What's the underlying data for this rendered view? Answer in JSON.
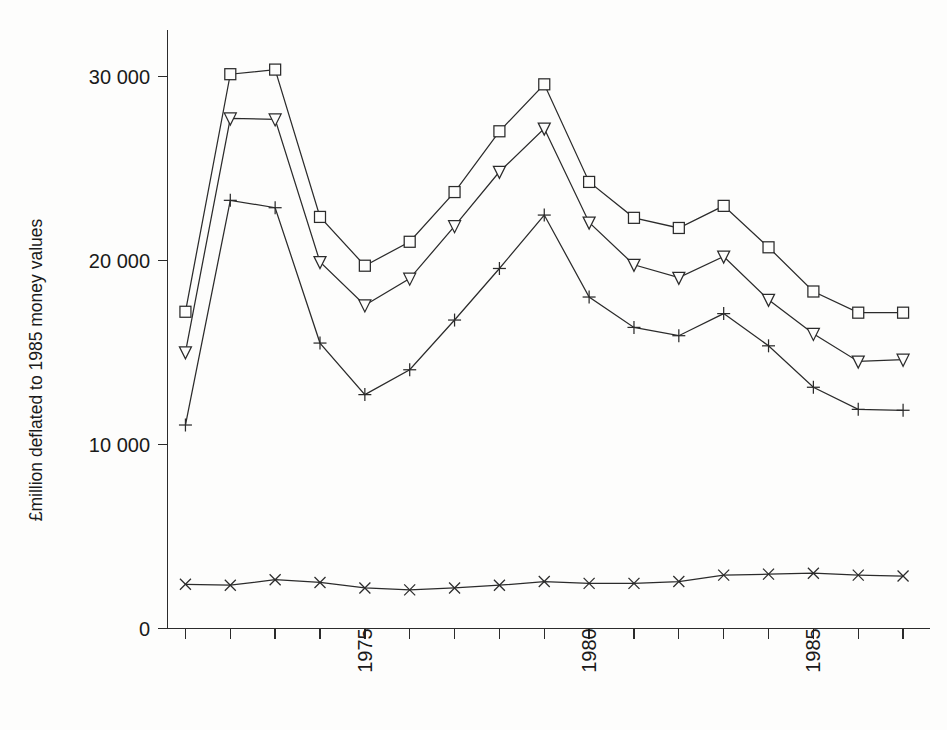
{
  "chart_data": {
    "type": "line",
    "title": "",
    "subtitle": "",
    "xlabel": "",
    "ylabel": "£million deflated to 1985 money values",
    "x": [
      1971,
      1972,
      1973,
      1974,
      1975,
      1976,
      1977,
      1978,
      1979,
      1980,
      1981,
      1982,
      1983,
      1984,
      1985,
      1986,
      1987
    ],
    "xlim": [
      1970.6,
      1987.6
    ],
    "ylim": [
      0,
      32500
    ],
    "yticks": [
      0,
      10000,
      20000,
      30000
    ],
    "ytick_labels": [
      "0",
      "10 000",
      "20 000",
      "30 000"
    ],
    "xticks": [
      1971,
      1972,
      1973,
      1974,
      1975,
      1976,
      1977,
      1978,
      1979,
      1980,
      1981,
      1982,
      1983,
      1984,
      1985,
      1986,
      1987
    ],
    "xtick_labels": [
      "",
      "",
      "",
      "",
      "1975",
      "",
      "",
      "",
      "",
      "1980",
      "",
      "",
      "",
      "",
      "1985",
      "",
      ""
    ],
    "xtick_label_rotation": -90,
    "grid": false,
    "legend": "none",
    "series": [
      {
        "name": "series-square",
        "marker": "square",
        "values": [
          17200,
          30100,
          30350,
          22350,
          19700,
          21000,
          23700,
          27000,
          29550,
          24250,
          22300,
          21750,
          22950,
          20700,
          18300,
          17150,
          17150
        ]
      },
      {
        "name": "series-triangle-down",
        "marker": "triangle-down",
        "values": [
          15000,
          27700,
          27650,
          19900,
          17550,
          19000,
          21850,
          24800,
          27150,
          22050,
          19750,
          19050,
          20200,
          17850,
          16000,
          14500,
          14600
        ]
      },
      {
        "name": "series-plus",
        "marker": "plus",
        "values": [
          11050,
          23250,
          22850,
          15500,
          12700,
          14050,
          16750,
          19550,
          22450,
          18000,
          16350,
          15900,
          17100,
          15350,
          13100,
          11900,
          11850
        ]
      },
      {
        "name": "series-cross",
        "marker": "cross",
        "values": [
          2400,
          2350,
          2650,
          2500,
          2200,
          2100,
          2200,
          2350,
          2550,
          2450,
          2450,
          2550,
          2900,
          2950,
          3000,
          2900,
          2850
        ]
      }
    ]
  },
  "axis": {
    "y_title": "£million deflated to 1985 money values",
    "y_labels": [
      "30 000",
      "20 000",
      "10 000",
      "0"
    ],
    "x_labels": [
      "1975",
      "1980",
      "1985"
    ]
  }
}
